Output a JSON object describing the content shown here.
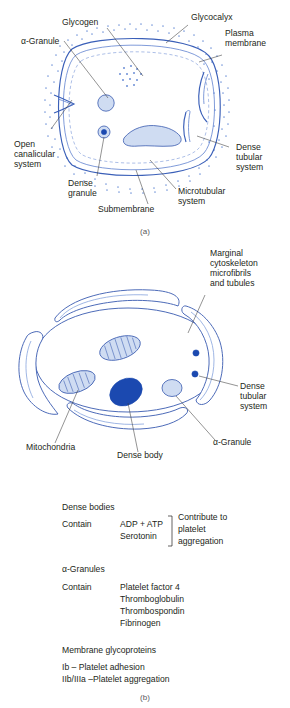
{
  "figure_a": {
    "caption": "(a)",
    "labels": {
      "glycogen": "Glycogen",
      "glycocalyx": "Glycocalyx",
      "plasma_membrane_l1": "Plasma",
      "plasma_membrane_l2": "membrane",
      "alpha_granule": "α-Granule",
      "open_canalicular_l1": "Open",
      "open_canalicular_l2": "canalicular",
      "open_canalicular_l3": "system",
      "dense_granule_l1": "Dense",
      "dense_granule_l2": "granule",
      "submembrane": "Submembrane",
      "dense_tubular_l1": "Dense",
      "dense_tubular_l2": "tubular",
      "dense_tubular_l3": "system",
      "microtubular_l1": "Microtubular",
      "microtubular_l2": "system"
    }
  },
  "figure_b": {
    "caption": "(b)",
    "labels": {
      "marginal_l1": "Marginal",
      "marginal_l2": "cytoskeleton",
      "marginal_l3": "microfibrils",
      "marginal_l4": "and tubules",
      "dense_tubular_l1": "Dense",
      "dense_tubular_l2": "tubular",
      "dense_tubular_l3": "system",
      "alpha_granule": "α-Granule",
      "mitochondria": "Mitochondria",
      "dense_body": "Dense body"
    }
  },
  "legend": {
    "dense_bodies": {
      "title": "Dense bodies",
      "contain_label": "Contain",
      "items": [
        "ADP + ATP",
        "Serotonin"
      ],
      "effect": [
        "Contribute to",
        "platelet",
        "aggregation"
      ]
    },
    "alpha_granules": {
      "title": "α-Granules",
      "contain_label": "Contain",
      "items": [
        "Platelet factor 4",
        "Thromboglobulin",
        "Thrombospondin",
        "Fibrinogen"
      ]
    },
    "membrane_glycoproteins": {
      "title": "Membrane glycoproteins",
      "items": [
        "Ib – Platelet adhesion",
        "IIb/IIIa –Platelet aggregation"
      ]
    }
  },
  "colors": {
    "membrane": "#3a5fb8",
    "organelle_fill": "#cfdcf2",
    "dense_body": "#1b49b0",
    "text": "#231f20"
  }
}
